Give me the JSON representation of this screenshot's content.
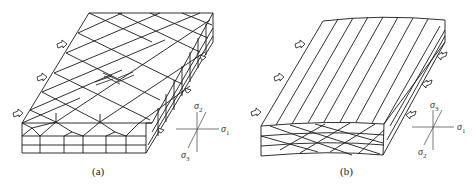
{
  "figures": [
    {
      "id": "a",
      "caption": "(a)",
      "description": "Block with conjugate diamond (rhombic) fracture/joint network on top surface, vertical segmented side face, hollow arrows on left edge indicating compression",
      "axes": {
        "vertical": "σ2",
        "horizontal": "σ1",
        "oblique": "σ3"
      },
      "axis_labels": {
        "vertical_sym": "σ",
        "vertical_sub": "2",
        "horizontal_sym": "σ",
        "horizontal_sub": "1",
        "oblique_sym": "σ",
        "oblique_sub": "3"
      },
      "arrows_count_left": 3,
      "arrows_count_right": 3
    },
    {
      "id": "b",
      "caption": "(b)",
      "description": "Curved block with parallel oblique lineations on top surface and conjugate crossing lines on front face, hollow arrows on left and right edges",
      "axes": {
        "vertical": "σ3",
        "horizontal": "σ1",
        "oblique": "σ2"
      },
      "axis_labels": {
        "vertical_sym": "σ",
        "vertical_sub": "3",
        "horizontal_sym": "σ",
        "horizontal_sub": "1",
        "oblique_sym": "σ",
        "oblique_sub": "2"
      },
      "arrows_count_left": 3,
      "arrows_count_right": 3
    }
  ],
  "colors": {
    "line": "#1a1a1a",
    "axis": "#555555",
    "background": "#ffffff"
  }
}
